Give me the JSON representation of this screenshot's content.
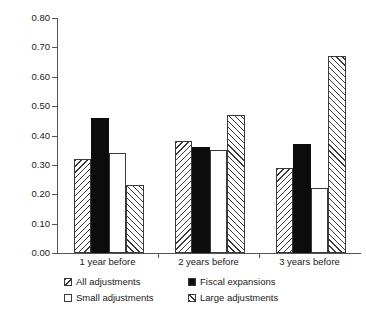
{
  "chart_data": {
    "type": "bar",
    "title": "",
    "subtitle": "",
    "xlabel": "",
    "ylabel": "",
    "categories": [
      "1 year before",
      "2 years before",
      "3 years before"
    ],
    "series": [
      {
        "name": "All adjustments",
        "fill": "hatch-back",
        "values": [
          0.32,
          0.38,
          0.29
        ]
      },
      {
        "name": "Fiscal expansions",
        "fill": "solid-black",
        "values": [
          0.46,
          0.36,
          0.37
        ]
      },
      {
        "name": "Small adjustments",
        "fill": "white",
        "values": [
          0.34,
          0.35,
          0.22
        ]
      },
      {
        "name": "Large adjustments",
        "fill": "hatch-fwd",
        "values": [
          0.23,
          0.47,
          0.67
        ]
      }
    ],
    "ylim": [
      0.0,
      0.8
    ],
    "ytick_step": 0.1,
    "ytick_labels": [
      "0.00",
      "0.10",
      "0.20",
      "0.30",
      "0.40",
      "0.50",
      "0.60",
      "0.70",
      "0.80"
    ],
    "grid": false,
    "legend_position": "bottom",
    "colors": {
      "axis": "#555555",
      "bar_outline": "#3a3a3a",
      "bar_solid": "#0c0c0c",
      "bar_empty": "#ffffff",
      "text": "#1a1a1a",
      "background": "#ffffff"
    }
  }
}
